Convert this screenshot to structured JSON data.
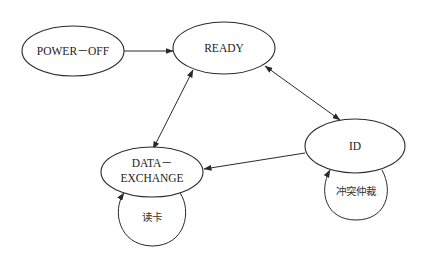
{
  "diagram": {
    "type": "state-transition",
    "nodes": [
      {
        "id": "power_off",
        "label": "POWER－OFF"
      },
      {
        "id": "ready",
        "label": "READY"
      },
      {
        "id": "id",
        "label": "ID"
      },
      {
        "id": "data_exchange",
        "label_line1": "DATA－",
        "label_line2": "EXCHANGE"
      }
    ],
    "self_loops": [
      {
        "node": "data_exchange",
        "label": "读卡"
      },
      {
        "node": "id",
        "label": "冲突仲裁"
      }
    ],
    "edges": [
      {
        "from": "power_off",
        "to": "ready",
        "direction": "one-way"
      },
      {
        "from": "ready",
        "to": "data_exchange",
        "direction": "bidirectional"
      },
      {
        "from": "ready",
        "to": "id",
        "direction": "bidirectional"
      },
      {
        "from": "id",
        "to": "data_exchange",
        "direction": "one-way"
      }
    ]
  }
}
